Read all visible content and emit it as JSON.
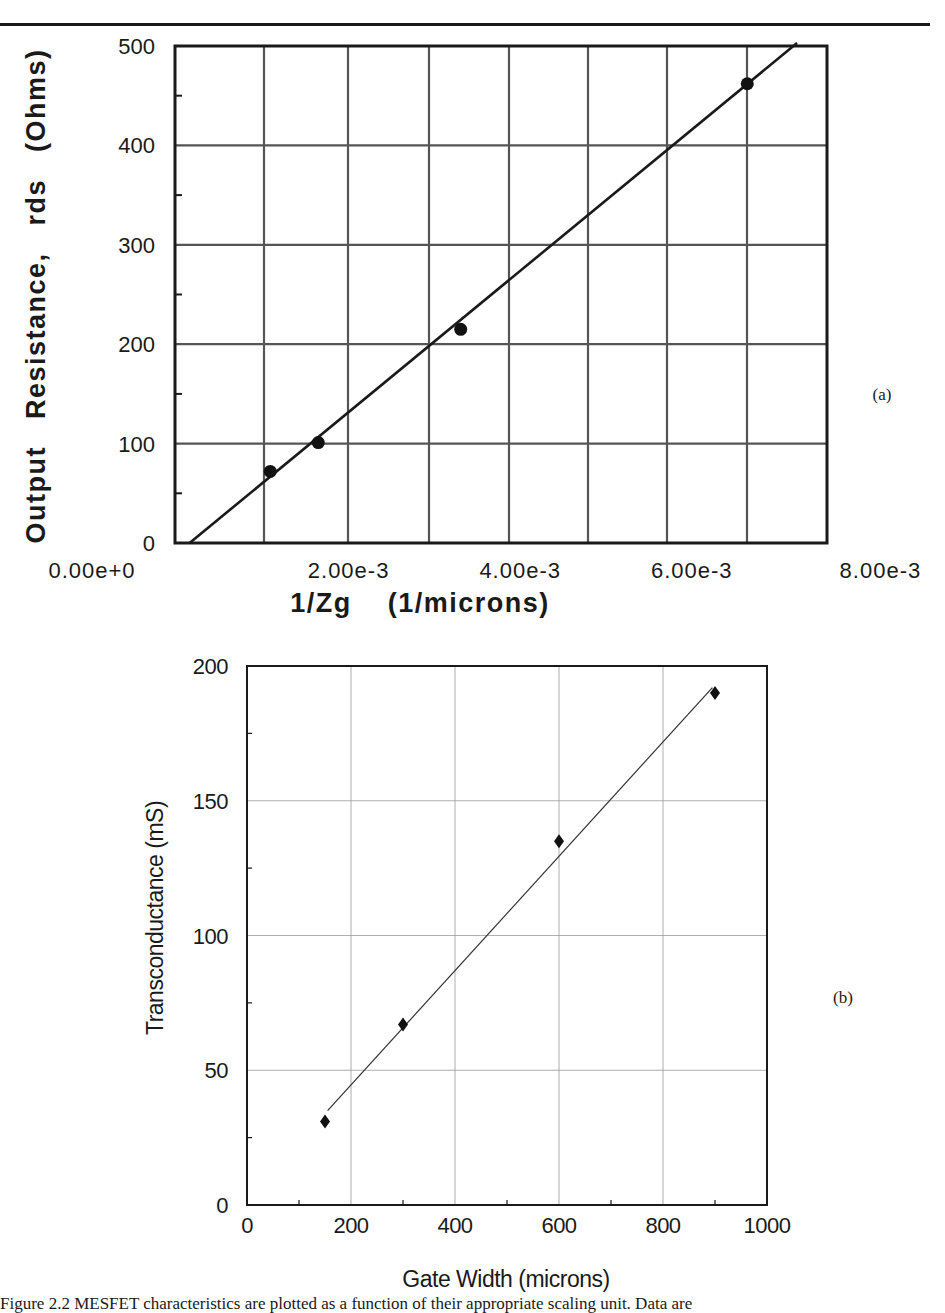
{
  "chart_data": [
    {
      "id": "a",
      "panel_label": "(a)",
      "type": "scatter",
      "title": "",
      "xlabel": "1/Zg    (1/microns)",
      "ylabel": "Output   Resistance,   rds   (Ohms)",
      "xlim": [
        0,
        0.0076
      ],
      "ylim": [
        0,
        500
      ],
      "x_ticks": [
        0,
        0.002,
        0.004,
        0.006,
        0.008
      ],
      "x_tick_labels": [
        "0.00e+0",
        "2.00e-3",
        "4.00e-3",
        "6.00e-3",
        "8.00e-3"
      ],
      "y_ticks": [
        0,
        100,
        200,
        300,
        400,
        500
      ],
      "y_tick_labels": [
        "0",
        "100",
        "200",
        "300",
        "400",
        "500"
      ],
      "grid": true,
      "legend": null,
      "series": [
        {
          "name": "measured",
          "marker": "filled-circle",
          "x": [
            0.00111,
            0.00167,
            0.00333,
            0.00667
          ],
          "y": [
            72,
            101,
            215,
            462
          ]
        },
        {
          "name": "linear fit",
          "type": "line",
          "x": [
            0.00017,
            0.00725
          ],
          "y": [
            0,
            500
          ]
        }
      ]
    },
    {
      "id": "b",
      "panel_label": "(b)",
      "type": "scatter",
      "title": "",
      "xlabel": "Gate Width (microns)",
      "ylabel": "Transconductance (mS)",
      "xlim": [
        0,
        1000
      ],
      "ylim": [
        0,
        200
      ],
      "x_ticks": [
        0,
        200,
        400,
        600,
        800,
        1000
      ],
      "x_tick_labels": [
        "0",
        "200",
        "400",
        "600",
        "800",
        "1000"
      ],
      "y_ticks": [
        0,
        50,
        100,
        150,
        200
      ],
      "y_tick_labels": [
        "0",
        "50",
        "100",
        "150",
        "200"
      ],
      "grid": true,
      "legend": null,
      "series": [
        {
          "name": "measured",
          "marker": "filled-diamond",
          "x": [
            150,
            300,
            600,
            900
          ],
          "y": [
            31,
            67,
            135,
            190
          ]
        },
        {
          "name": "linear fit",
          "type": "line",
          "x": [
            155,
            895
          ],
          "y": [
            35,
            192
          ]
        }
      ]
    }
  ],
  "figure": {
    "caption_partial": "Figure 2.2 MESFET characteristics are plotted as a function of their appropriate scaling unit. Data are"
  }
}
